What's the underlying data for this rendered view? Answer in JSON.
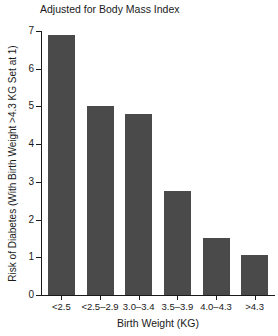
{
  "chart_data": {
    "type": "bar",
    "title": "Adjusted for Body Mass Index",
    "xlabel": "Birth Weight (KG)",
    "ylabel": "Risk of Diabetes (With Birth Weight >4.3 KG Set at 1)",
    "categories": [
      "<2.5",
      "<2.5–2.9",
      "3.0–3.4",
      "3.5–3.9",
      "4.0–4.3",
      ">4.3"
    ],
    "values": [
      6.9,
      5.0,
      4.8,
      2.75,
      1.5,
      1.05
    ],
    "ylim": [
      0,
      7
    ],
    "yticks": [
      0,
      1,
      2,
      3,
      4,
      5,
      6,
      7
    ],
    "ytick_labels": [
      "0",
      "1",
      "2",
      "3",
      "4",
      "5",
      "6",
      "7"
    ],
    "grid": false,
    "legend": false,
    "bar_color": "#4a4a4a",
    "axis_color": "#1a1a1a",
    "background": "#ffffff"
  }
}
